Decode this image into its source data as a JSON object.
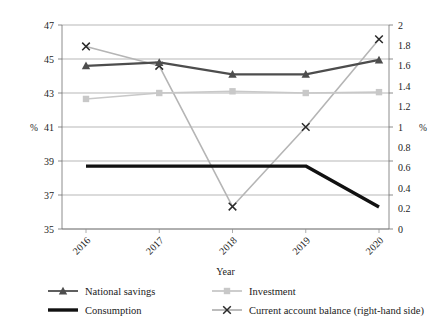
{
  "chart_data": {
    "type": "line",
    "title": "",
    "xlabel": "Year",
    "ylabel": "%",
    "ylabel_right": "%",
    "categories": [
      "2016",
      "2017",
      "2018",
      "2019",
      "2020"
    ],
    "ylim": [
      35,
      47
    ],
    "yticks": [
      "35",
      "37",
      "39",
      "41",
      "43",
      "45",
      "47"
    ],
    "ylim_right": [
      0,
      2
    ],
    "yticks_right": [
      "0",
      "0.2",
      "0.4",
      "0.6",
      "0.8",
      "1",
      "1.2",
      "1.4",
      "1.6",
      "1.8",
      "2"
    ],
    "grid": true,
    "legend_position": "bottom",
    "series": [
      {
        "name": "National savings",
        "axis": "left",
        "marker": "triangle",
        "color": "#4d4d4d",
        "values": [
          44.6,
          44.8,
          44.1,
          44.1,
          44.95
        ]
      },
      {
        "name": "Investment",
        "axis": "left",
        "marker": "square",
        "color": "#c8c8c8",
        "values": [
          42.65,
          43.0,
          43.1,
          43.0,
          43.05
        ]
      },
      {
        "name": "Consumption",
        "axis": "left",
        "marker": "none",
        "color": "#111111",
        "values": [
          38.7,
          38.7,
          38.7,
          38.7,
          36.3
        ]
      },
      {
        "name": "Current account balance (right-hand side)",
        "axis": "right",
        "marker": "x",
        "color": "#b5b5b5",
        "values": [
          1.79,
          1.6,
          0.22,
          1.0,
          1.86
        ]
      }
    ]
  },
  "legend": {
    "items": [
      {
        "label": "National savings"
      },
      {
        "label": "Investment"
      },
      {
        "label": "Consumption"
      },
      {
        "label": "Current account balance (right-hand side)"
      }
    ]
  },
  "axes": {
    "left_unit": "%",
    "right_unit": "%",
    "x_title": "Year"
  }
}
